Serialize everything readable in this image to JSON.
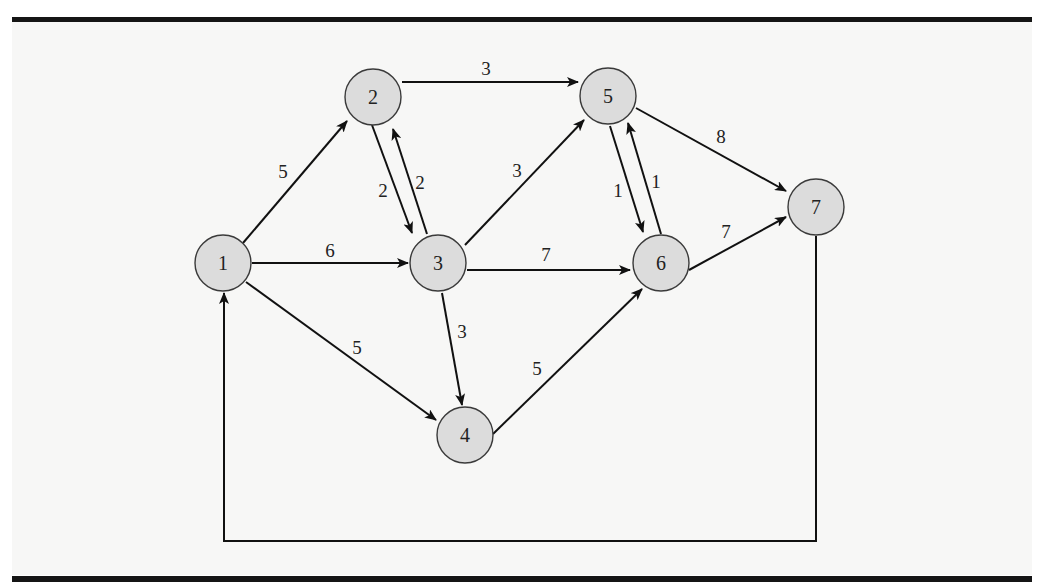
{
  "diagram": {
    "type": "directed-weighted-network",
    "nodes": [
      {
        "id": "1",
        "label": "1",
        "x": 223,
        "y": 263
      },
      {
        "id": "2",
        "label": "2",
        "x": 373,
        "y": 97
      },
      {
        "id": "3",
        "label": "3",
        "x": 438,
        "y": 263
      },
      {
        "id": "4",
        "label": "4",
        "x": 465,
        "y": 435
      },
      {
        "id": "5",
        "label": "5",
        "x": 608,
        "y": 96
      },
      {
        "id": "6",
        "label": "6",
        "x": 661,
        "y": 263
      },
      {
        "id": "7",
        "label": "7",
        "x": 816,
        "y": 207
      }
    ],
    "edges": [
      {
        "from": "1",
        "to": "2",
        "weight": "5"
      },
      {
        "from": "1",
        "to": "3",
        "weight": "6"
      },
      {
        "from": "1",
        "to": "4",
        "weight": "5"
      },
      {
        "from": "2",
        "to": "3",
        "weight": "2"
      },
      {
        "from": "3",
        "to": "2",
        "weight": "2"
      },
      {
        "from": "2",
        "to": "5",
        "weight": "3"
      },
      {
        "from": "3",
        "to": "5",
        "weight": "3"
      },
      {
        "from": "3",
        "to": "6",
        "weight": "7"
      },
      {
        "from": "3",
        "to": "4",
        "weight": "3"
      },
      {
        "from": "4",
        "to": "6",
        "weight": "5"
      },
      {
        "from": "5",
        "to": "6",
        "weight": "1"
      },
      {
        "from": "6",
        "to": "5",
        "weight": "1"
      },
      {
        "from": "5",
        "to": "7",
        "weight": "8"
      },
      {
        "from": "6",
        "to": "7",
        "weight": "7"
      },
      {
        "from": "7",
        "to": "1",
        "weight": ""
      }
    ]
  },
  "colors": {
    "node_fill": "#dcdcdc",
    "node_stroke": "#3a3a3a",
    "edge": "#111111",
    "background": "#f7f7f6",
    "rule": "#151515"
  }
}
